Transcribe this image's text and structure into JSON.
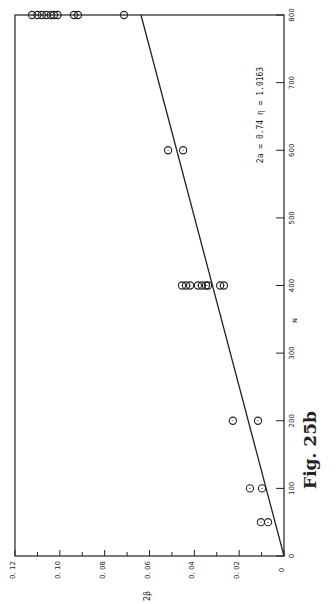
{
  "chart_data": {
    "type": "scatter",
    "orientation": "rotated 90° counter-clockwise (N axis vertical on right, 2β axis horizontal along bottom)",
    "title": "",
    "figure_label": "Fig. 25b",
    "xlabel": "N",
    "ylabel": "2β",
    "xlim": [
      0,
      800
    ],
    "ylim": [
      0,
      0.12
    ],
    "x_ticks": [
      "0",
      "100",
      "200",
      "300",
      "400",
      "500",
      "600",
      "700",
      "800"
    ],
    "y_ticks": [
      "0",
      "0.02",
      "0.04",
      "0.06",
      "0.08",
      "0.10",
      "0.12"
    ],
    "annotation": "2a = 0.74    η = 1.0163",
    "grid": false,
    "series": [
      {
        "name": "measured",
        "marker": "open circle",
        "points": [
          [
            50,
            0.0103
          ],
          [
            50,
            0.0071
          ],
          [
            100,
            0.0152
          ],
          [
            100,
            0.0098
          ],
          [
            200,
            0.0228
          ],
          [
            200,
            0.0116
          ],
          [
            400,
            0.0455
          ],
          [
            400,
            0.0437
          ],
          [
            400,
            0.0419
          ],
          [
            400,
            0.0384
          ],
          [
            400,
            0.0366
          ],
          [
            400,
            0.0348
          ],
          [
            400,
            0.0339
          ],
          [
            400,
            0.0285
          ],
          [
            400,
            0.0268
          ],
          [
            600,
            0.0517
          ],
          [
            600,
            0.045
          ],
          [
            800,
            0.1124
          ],
          [
            800,
            0.11
          ],
          [
            800,
            0.108
          ],
          [
            800,
            0.106
          ],
          [
            800,
            0.104
          ],
          [
            800,
            0.1026
          ],
          [
            800,
            0.101
          ],
          [
            800,
            0.0937
          ],
          [
            800,
            0.0919
          ],
          [
            800,
            0.0714
          ]
        ]
      },
      {
        "name": "fit line",
        "type": "line",
        "points": [
          [
            0,
            0
          ],
          [
            800,
            0.0638
          ]
        ]
      }
    ]
  }
}
